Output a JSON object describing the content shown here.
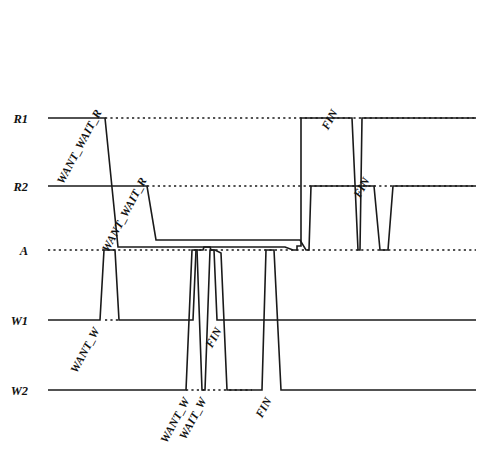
{
  "figure": {
    "kind": "timing-diagram",
    "title": "",
    "background_color": "#ffffff",
    "line_color": "#1a1a1a",
    "width": 483,
    "height": 473
  },
  "axis": {
    "labels": [
      {
        "name": "R1",
        "text": "R1",
        "y": 118
      },
      {
        "name": "R2",
        "text": "R2",
        "y": 186
      },
      {
        "name": "A",
        "text": "A",
        "y": 250
      },
      {
        "name": "W1",
        "text": "W1",
        "y": 320
      },
      {
        "name": "W2",
        "text": "W2",
        "y": 390
      }
    ],
    "label_x": 28,
    "track_start_x": 48,
    "track_end_x": 476
  },
  "event_labels": [
    {
      "id": "r1-want-wait-r",
      "text": "WANT_WAIT_R",
      "x": 102,
      "y": 112,
      "rotation": -62
    },
    {
      "id": "r2-want-wait-r",
      "text": "WANT_WAIT_R",
      "x": 147,
      "y": 180,
      "rotation": -62
    },
    {
      "id": "r1-fin",
      "text": "FIN",
      "x": 338,
      "y": 112,
      "rotation": -62
    },
    {
      "id": "r2-fin",
      "text": "FIN",
      "x": 370,
      "y": 180,
      "rotation": -62
    },
    {
      "id": "w1-want-w",
      "text": "WANT_W",
      "x": 100,
      "y": 330,
      "rotation": -62
    },
    {
      "id": "w1-fin",
      "text": "FIN",
      "x": 222,
      "y": 330,
      "rotation": -62
    },
    {
      "id": "w2-want-w",
      "text": "WANT_W",
      "x": 190,
      "y": 400,
      "rotation": -62
    },
    {
      "id": "w2-wait-w",
      "text": "WAIT_W",
      "x": 207,
      "y": 400,
      "rotation": -62
    },
    {
      "id": "w2-fin",
      "text": "FIN",
      "x": 272,
      "y": 400,
      "rotation": -62
    }
  ],
  "guides": [
    {
      "id": "guide-r1",
      "y": 118,
      "x1": 105,
      "x2": 476
    },
    {
      "id": "guide-r2",
      "y": 186,
      "x1": 147,
      "x2": 476
    },
    {
      "id": "guide-a",
      "y": 250,
      "x1": 48,
      "x2": 476
    },
    {
      "id": "guide-w1",
      "y": 320,
      "x1": 105,
      "x2": 120
    },
    {
      "id": "guide-w2",
      "y": 390,
      "x1": 186,
      "x2": 252
    }
  ],
  "waveforms": [
    {
      "id": "wave-r1",
      "name": "R1 resource signal",
      "points": "48,118 105,118 118,247 166,247 285,247 293,250 297,250 297,246 301,246 301,118 352,118 358,250 360,250 362,118 476,118"
    },
    {
      "id": "wave-r2",
      "name": "R2 resource signal",
      "points": "48,186 147,186 156,240 300,240 306,250 309,250 311,186 374,186 380,250 388,250 393,186 476,186"
    },
    {
      "id": "wave-w1",
      "name": "W1 writer signal",
      "points": "48,320 100,320 104,250 115,250 119,320 193,320 196,250 203,250 204,247 210,247 211,250 214,250 217,320 476,320"
    },
    {
      "id": "wave-w2",
      "name": "W2 writer signal",
      "points": "48,390 186,390 192,250 197,250 202,390 205,390 210,250 215,250 221,253 227,390 262,390 266,250 274,250 281,390 476,390"
    }
  ]
}
